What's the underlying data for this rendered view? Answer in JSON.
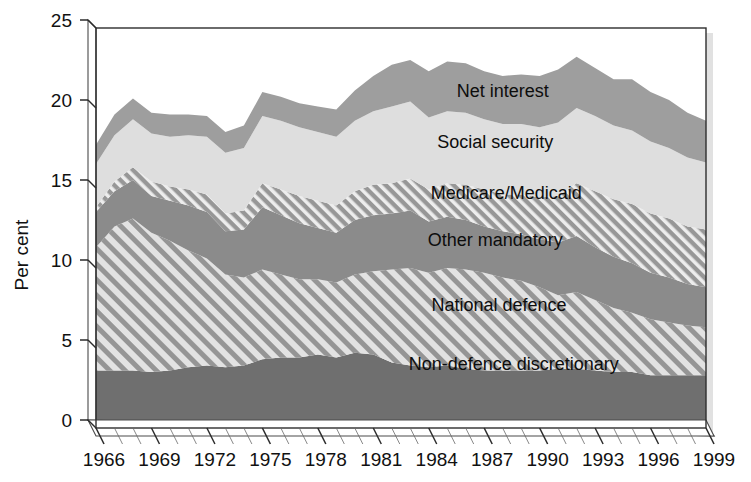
{
  "chart_data": {
    "type": "area",
    "title": "",
    "subtitle": "",
    "xlabel": "",
    "ylabel": "Per cent",
    "xlim": [
      1966,
      1999
    ],
    "ylim": [
      0,
      25
    ],
    "grid": false,
    "legend_position": "inline-labels",
    "stacked": true,
    "x": [
      1966,
      1967,
      1968,
      1969,
      1970,
      1971,
      1972,
      1973,
      1974,
      1975,
      1976,
      1977,
      1978,
      1979,
      1980,
      1981,
      1982,
      1983,
      1984,
      1985,
      1986,
      1987,
      1988,
      1989,
      1990,
      1991,
      1992,
      1993,
      1994,
      1995,
      1996,
      1997,
      1998,
      1999
    ],
    "xtick_labels": [
      "1966",
      "1969",
      "1972",
      "1975",
      "1978",
      "1981",
      "1984",
      "1987",
      "1990",
      "1993",
      "1996",
      "1999"
    ],
    "ytick_labels": [
      "0",
      "5",
      "10",
      "15",
      "20",
      "25"
    ],
    "ytick_values": [
      0,
      5,
      10,
      15,
      20,
      25
    ],
    "series": [
      {
        "name": "Non-defence discretionary",
        "fill": "#6f6f6f",
        "pattern": "solid",
        "values": [
          3.6,
          3.6,
          3.6,
          3.5,
          3.6,
          3.8,
          3.9,
          3.8,
          3.9,
          4.3,
          4.4,
          4.4,
          4.6,
          4.4,
          4.7,
          4.6,
          4.1,
          3.9,
          3.8,
          3.9,
          3.7,
          3.6,
          3.6,
          3.6,
          3.6,
          3.7,
          3.7,
          3.6,
          3.5,
          3.5,
          3.3,
          3.3,
          3.3,
          3.3
        ]
      },
      {
        "name": "National defence",
        "fill": "#9c9c9c",
        "pattern": "diagonal-hatch-coarse",
        "values": [
          7.7,
          9.0,
          9.5,
          8.7,
          8.1,
          7.3,
          6.7,
          5.8,
          5.5,
          5.6,
          5.2,
          4.9,
          4.7,
          4.7,
          4.9,
          5.2,
          5.8,
          6.1,
          5.9,
          6.1,
          6.2,
          6.1,
          5.8,
          5.6,
          5.2,
          4.6,
          4.8,
          4.4,
          4.0,
          3.7,
          3.5,
          3.3,
          3.1,
          3.0
        ]
      },
      {
        "name": "Other mandatory",
        "fill": "#8b8b8b",
        "pattern": "solid",
        "values": [
          2.2,
          2.2,
          2.4,
          2.3,
          2.5,
          2.8,
          2.9,
          2.7,
          3.0,
          3.9,
          3.7,
          3.5,
          3.2,
          3.1,
          3.4,
          3.5,
          3.5,
          3.6,
          3.2,
          3.2,
          3.1,
          2.9,
          2.9,
          2.9,
          3.0,
          3.3,
          3.5,
          3.3,
          3.2,
          3.1,
          2.9,
          2.8,
          2.6,
          2.5
        ]
      },
      {
        "name": "Medicare/Medicaid",
        "fill": "#9a9a9a",
        "pattern": "diagonal-hatch-fine",
        "values": [
          0.3,
          0.6,
          0.8,
          0.9,
          0.9,
          1.0,
          1.1,
          1.1,
          1.2,
          1.5,
          1.6,
          1.7,
          1.7,
          1.7,
          1.8,
          1.9,
          1.9,
          2.0,
          2.0,
          2.1,
          2.2,
          2.3,
          2.3,
          2.5,
          2.6,
          2.9,
          3.3,
          3.5,
          3.6,
          3.7,
          3.7,
          3.7,
          3.6,
          3.6
        ]
      },
      {
        "name": "Social security",
        "fill": "#dedede",
        "pattern": "solid",
        "values": [
          2.7,
          2.9,
          3.0,
          3.0,
          3.1,
          3.4,
          3.6,
          3.8,
          3.9,
          4.2,
          4.3,
          4.3,
          4.3,
          4.3,
          4.4,
          4.6,
          4.8,
          4.8,
          4.5,
          4.5,
          4.5,
          4.4,
          4.4,
          4.4,
          4.4,
          4.6,
          4.7,
          4.7,
          4.6,
          4.6,
          4.5,
          4.4,
          4.3,
          4.2
        ]
      },
      {
        "name": "Net interest",
        "fill": "#9e9e9e",
        "pattern": "solid",
        "values": [
          1.2,
          1.3,
          1.3,
          1.3,
          1.4,
          1.3,
          1.3,
          1.3,
          1.4,
          1.5,
          1.5,
          1.5,
          1.6,
          1.7,
          1.9,
          2.2,
          2.6,
          2.6,
          2.9,
          3.1,
          3.1,
          3.0,
          3.0,
          3.1,
          3.2,
          3.3,
          3.2,
          3.0,
          2.9,
          3.2,
          3.1,
          3.0,
          2.8,
          2.6
        ]
      }
    ],
    "annotations": [
      {
        "text": "Net interest",
        "x": 1988.0,
        "y": 20.7
      },
      {
        "text": "Social security",
        "x": 1987.6,
        "y": 17.5
      },
      {
        "text": "Medicare/Medicaid",
        "x": 1988.2,
        "y": 14.3
      },
      {
        "text": "Other mandatory",
        "x": 1987.6,
        "y": 11.4
      },
      {
        "text": "National defence",
        "x": 1987.8,
        "y": 7.3
      },
      {
        "text": "Non-defence discretionary",
        "x": 1988.6,
        "y": 3.6
      }
    ]
  },
  "axes": {
    "y_axis_title": "Per cent",
    "y_ticks": [
      "25",
      "20",
      "15",
      "10",
      "5",
      "0"
    ],
    "x_ticks": [
      "1966",
      "1969",
      "1972",
      "1975",
      "1978",
      "1981",
      "1984",
      "1987",
      "1990",
      "1993",
      "1996",
      "1999"
    ]
  },
  "colors": {
    "non_defence_discretionary": "#6f6f6f",
    "national_defence": "#9c9c9c",
    "other_mandatory": "#8b8b8b",
    "medicare_medicaid": "#9a9a9a",
    "social_security": "#dedede",
    "net_interest": "#9e9e9e",
    "axis": "#2b2b2b",
    "text": "#111111",
    "background": "#ffffff"
  }
}
